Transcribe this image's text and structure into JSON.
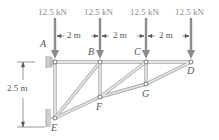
{
  "loads": [
    {
      "label": "12.5 kN",
      "x": 55
    },
    {
      "label": "12.5 kN",
      "x": 100
    },
    {
      "label": "12.5 kN",
      "x": 146
    },
    {
      "label": "12.5 kN",
      "x": 191
    }
  ],
  "spans": [
    {
      "label": "2 m"
    },
    {
      "label": "2 m"
    },
    {
      "label": "2 m"
    }
  ],
  "height_dim": {
    "label": "2.5 m"
  },
  "nodes": {
    "A": {
      "label": "A"
    },
    "B": {
      "label": "B"
    },
    "C": {
      "label": "C"
    },
    "D": {
      "label": "D"
    },
    "E": {
      "label": "E"
    },
    "F": {
      "label": "F"
    },
    "G": {
      "label": "G"
    }
  },
  "colors": {
    "member": "#d9d9d9",
    "member_edge": "#a8a8a8",
    "load_arrow": "#8c8c8c",
    "text": "#444444",
    "support": "#bdbdbd"
  }
}
